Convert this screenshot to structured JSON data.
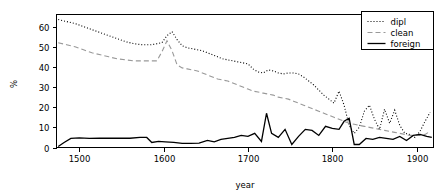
{
  "chart_data": {
    "type": "line",
    "title": "",
    "subtitle": "",
    "xlabel": "year",
    "ylabel": "%",
    "xlim": [
      1473,
      1920
    ],
    "ylim": [
      0,
      66
    ],
    "xticks": [
      1500,
      1600,
      1700,
      1800,
      1900
    ],
    "xticklabels": [
      "1500",
      "1600",
      "1700",
      "1800",
      "1900"
    ],
    "yticks": [
      0,
      10,
      20,
      30,
      40,
      50,
      60
    ],
    "yticklabels": [
      "0",
      "10",
      "20",
      "30",
      "40",
      "50",
      "60"
    ],
    "grid": false,
    "legend_position": "top-right",
    "legend_entries": [
      "dipl",
      "clean",
      "foreign"
    ],
    "series": [
      {
        "name": "dipl",
        "linestyle": "dotted",
        "color": "#000000",
        "x": [
          1475,
          1485,
          1495,
          1505,
          1515,
          1525,
          1535,
          1545,
          1555,
          1565,
          1575,
          1585,
          1592,
          1598,
          1604,
          1610,
          1616,
          1622,
          1628,
          1634,
          1640,
          1646,
          1652,
          1658,
          1664,
          1670,
          1676,
          1682,
          1688,
          1694,
          1700,
          1706,
          1712,
          1718,
          1724,
          1730,
          1736,
          1742,
          1748,
          1754,
          1760,
          1766,
          1772,
          1778,
          1784,
          1790,
          1796,
          1802,
          1808,
          1814,
          1820,
          1826,
          1832,
          1838,
          1844,
          1850,
          1856,
          1862,
          1868,
          1874,
          1880,
          1886,
          1892,
          1898,
          1904,
          1910,
          1916
        ],
        "y": [
          63.5,
          62.5,
          61.5,
          60.0,
          58.5,
          57.0,
          55.5,
          54.0,
          52.5,
          51.5,
          51.0,
          51.0,
          51.5,
          52.0,
          55.5,
          57.5,
          53.5,
          50.5,
          49.5,
          49.0,
          48.5,
          48.0,
          47.0,
          46.0,
          45.0,
          44.0,
          43.5,
          43.0,
          42.5,
          42.0,
          41.5,
          39.0,
          37.5,
          37.0,
          38.5,
          38.0,
          37.0,
          36.5,
          37.0,
          37.0,
          36.5,
          35.0,
          33.0,
          31.0,
          28.5,
          26.0,
          24.0,
          22.0,
          28.0,
          21.0,
          11.0,
          7.0,
          10.0,
          18.0,
          21.0,
          14.0,
          9.0,
          19.0,
          12.0,
          18.5,
          11.0,
          7.0,
          6.5,
          5.0,
          8.0,
          13.0,
          17.5
        ]
      },
      {
        "name": "clean",
        "linestyle": "dashed",
        "color": "#999999",
        "x": [
          1475,
          1485,
          1495,
          1505,
          1515,
          1525,
          1535,
          1545,
          1555,
          1565,
          1575,
          1585,
          1592,
          1598,
          1604,
          1610,
          1616,
          1622,
          1628,
          1634,
          1640,
          1646,
          1652,
          1658,
          1664,
          1670,
          1676,
          1682,
          1688,
          1694,
          1700,
          1706,
          1712,
          1718,
          1724,
          1730,
          1736,
          1742,
          1748,
          1754,
          1760,
          1766,
          1772,
          1778,
          1784,
          1790,
          1796,
          1802,
          1808,
          1814,
          1820,
          1826,
          1832,
          1838,
          1844,
          1850,
          1856,
          1862,
          1868,
          1874,
          1880,
          1886,
          1892,
          1898,
          1904,
          1910,
          1916
        ],
        "y": [
          52.0,
          51.0,
          50.0,
          48.5,
          47.0,
          46.0,
          45.0,
          44.0,
          43.5,
          43.0,
          43.0,
          43.0,
          43.0,
          47.5,
          53.0,
          48.0,
          41.0,
          39.5,
          39.0,
          38.5,
          38.0,
          37.0,
          36.0,
          35.0,
          34.0,
          33.5,
          33.0,
          32.0,
          31.0,
          30.0,
          29.0,
          28.0,
          27.5,
          27.0,
          26.5,
          26.0,
          25.0,
          24.5,
          24.0,
          23.0,
          22.0,
          21.0,
          20.0,
          19.0,
          18.0,
          17.0,
          16.0,
          15.0,
          14.0,
          13.0,
          12.0,
          11.5,
          11.0,
          10.5,
          10.0,
          9.5,
          9.0,
          8.5,
          8.0,
          7.5,
          7.0,
          6.5,
          6.0,
          6.0,
          6.0,
          6.5,
          8.0
        ]
      },
      {
        "name": "foreign",
        "linestyle": "solid",
        "color": "#000000",
        "x": [
          1475,
          1482,
          1490,
          1500,
          1512,
          1524,
          1536,
          1548,
          1560,
          1572,
          1580,
          1586,
          1594,
          1602,
          1612,
          1622,
          1632,
          1642,
          1652,
          1660,
          1668,
          1676,
          1684,
          1692,
          1700,
          1708,
          1716,
          1722,
          1728,
          1736,
          1744,
          1752,
          1760,
          1768,
          1776,
          1784,
          1792,
          1800,
          1808,
          1814,
          1820,
          1826,
          1832,
          1840,
          1848,
          1856,
          1864,
          1872,
          1880,
          1888,
          1896,
          1904,
          1912,
          1918
        ],
        "y": [
          0.5,
          2.5,
          4.5,
          4.8,
          4.5,
          4.6,
          4.6,
          4.6,
          4.6,
          5.0,
          5.0,
          2.5,
          3.0,
          2.8,
          2.5,
          2.0,
          2.0,
          2.2,
          3.5,
          2.8,
          4.0,
          4.5,
          5.0,
          6.0,
          5.5,
          7.0,
          3.0,
          17.0,
          7.0,
          5.0,
          9.0,
          1.5,
          5.5,
          9.0,
          8.5,
          6.0,
          10.5,
          9.5,
          9.0,
          13.0,
          14.5,
          1.5,
          1.5,
          4.5,
          4.0,
          5.0,
          4.5,
          4.0,
          5.5,
          3.5,
          6.0,
          6.5,
          5.5,
          5.0
        ]
      }
    ]
  }
}
